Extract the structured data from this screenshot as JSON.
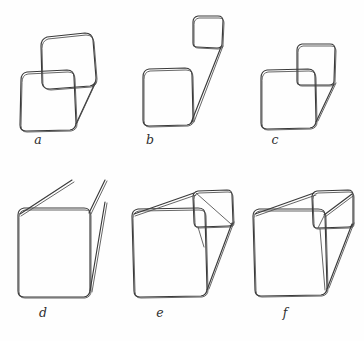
{
  "figure": {
    "background_color": "#fefefe",
    "ink_color": "#3a3a3a",
    "panel_count": 6,
    "rows": 2,
    "columns": 3,
    "labels": {
      "a": "a",
      "b": "b",
      "c": "c",
      "d": "d",
      "e": "e",
      "f": "f"
    },
    "panels": [
      {
        "id": "a",
        "label": "a",
        "label_position": {
          "x": 38,
          "y": 140
        },
        "description": "Large square lower-left overlapped by a second square upper-right, with a short diagonal from the right edge down to the lower square's bottom-right corner",
        "elements": [
          "front-square",
          "offset-square",
          "connector-diagonal"
        ]
      },
      {
        "id": "b",
        "label": "b",
        "label_position": {
          "x": 150,
          "y": 140
        },
        "description": "Large square lower-left and a small detached square upper-right joined by a single long double line",
        "elements": [
          "front-square",
          "small-square",
          "long-connector"
        ]
      },
      {
        "id": "c",
        "label": "c",
        "label_position": {
          "x": 275,
          "y": 140
        },
        "description": "Large square with a small square attached at its top-right corner and a diagonal running down to the bottom-right corner",
        "elements": [
          "front-square",
          "corner-square",
          "connector-diagonal"
        ]
      },
      {
        "id": "d",
        "label": "d",
        "label_position": {
          "x": 43,
          "y": 313
        },
        "description": "Square with two parallel oblique lines rising from the top edge and one oblique line descending to the bottom-right corner",
        "elements": [
          "front-square",
          "top-oblique-left",
          "top-oblique-right",
          "side-oblique"
        ]
      },
      {
        "id": "e",
        "label": "e",
        "label_position": {
          "x": 160,
          "y": 313
        },
        "description": "Square with a small square at the upper right, joined by oblique lines forming a partial box; a diagonal crosses the small square",
        "elements": [
          "front-square",
          "corner-square",
          "top-oblique",
          "side-oblique",
          "inner-diagonal"
        ]
      },
      {
        "id": "f",
        "label": "f",
        "label_position": {
          "x": 285,
          "y": 313
        },
        "description": "Completed transparent cube: front square, rear square at upper right, and four connecting oblique edges",
        "elements": [
          "front-square",
          "rear-square",
          "edge-top-left",
          "edge-top-right",
          "edge-bottom-right",
          "inner-edge"
        ]
      }
    ]
  }
}
